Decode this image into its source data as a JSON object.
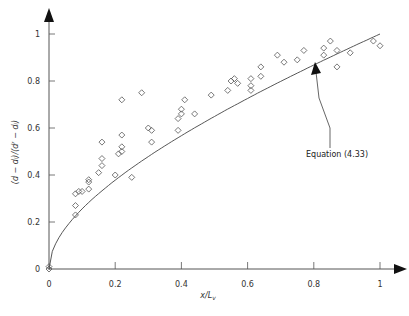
{
  "chart_data": {
    "type": "scatter",
    "title": "",
    "xlabel": "x/L_v",
    "ylabel": "(d − d_i)/(d_f − d_i)",
    "xlim": [
      0,
      1.05
    ],
    "ylim": [
      0,
      1.05
    ],
    "x_ticks": [
      "0",
      "0.2",
      "0.4",
      "0.6",
      "0.8",
      "1"
    ],
    "y_ticks": [
      "0",
      "0.2",
      "0.4",
      "0.6",
      "0.8",
      "1"
    ],
    "grid": false,
    "legend": null,
    "series": [
      {
        "name": "Measured data",
        "marker": "diamond-open",
        "points": [
          [
            0.0,
            0.0
          ],
          [
            0.0,
            0.01
          ],
          [
            0.08,
            0.23
          ],
          [
            0.08,
            0.27
          ],
          [
            0.08,
            0.32
          ],
          [
            0.09,
            0.33
          ],
          [
            0.1,
            0.33
          ],
          [
            0.12,
            0.34
          ],
          [
            0.12,
            0.37
          ],
          [
            0.12,
            0.38
          ],
          [
            0.15,
            0.41
          ],
          [
            0.16,
            0.44
          ],
          [
            0.16,
            0.47
          ],
          [
            0.16,
            0.54
          ],
          [
            0.2,
            0.4
          ],
          [
            0.21,
            0.49
          ],
          [
            0.22,
            0.5
          ],
          [
            0.22,
            0.52
          ],
          [
            0.22,
            0.57
          ],
          [
            0.22,
            0.72
          ],
          [
            0.25,
            0.39
          ],
          [
            0.28,
            0.75
          ],
          [
            0.3,
            0.6
          ],
          [
            0.31,
            0.54
          ],
          [
            0.31,
            0.59
          ],
          [
            0.39,
            0.59
          ],
          [
            0.39,
            0.64
          ],
          [
            0.4,
            0.66
          ],
          [
            0.4,
            0.68
          ],
          [
            0.41,
            0.72
          ],
          [
            0.44,
            0.66
          ],
          [
            0.49,
            0.74
          ],
          [
            0.54,
            0.76
          ],
          [
            0.55,
            0.8
          ],
          [
            0.56,
            0.81
          ],
          [
            0.57,
            0.79
          ],
          [
            0.61,
            0.78
          ],
          [
            0.61,
            0.76
          ],
          [
            0.61,
            0.81
          ],
          [
            0.64,
            0.82
          ],
          [
            0.64,
            0.86
          ],
          [
            0.69,
            0.91
          ],
          [
            0.71,
            0.88
          ],
          [
            0.75,
            0.89
          ],
          [
            0.77,
            0.93
          ],
          [
            0.83,
            0.91
          ],
          [
            0.83,
            0.94
          ],
          [
            0.85,
            0.97
          ],
          [
            0.87,
            0.86
          ],
          [
            0.87,
            0.93
          ],
          [
            0.91,
            0.92
          ],
          [
            0.98,
            0.97
          ],
          [
            1.0,
            0.95
          ]
        ]
      },
      {
        "name": "Equation (4.33)",
        "line": "solid",
        "points": [
          [
            0.0,
            0.0
          ],
          [
            0.01,
            0.1
          ],
          [
            0.03,
            0.17
          ],
          [
            0.05,
            0.22
          ],
          [
            0.08,
            0.28
          ],
          [
            0.1,
            0.32
          ],
          [
            0.15,
            0.39
          ],
          [
            0.2,
            0.45
          ],
          [
            0.25,
            0.5
          ],
          [
            0.3,
            0.55
          ],
          [
            0.35,
            0.59
          ],
          [
            0.4,
            0.63
          ],
          [
            0.5,
            0.71
          ],
          [
            0.6,
            0.77
          ],
          [
            0.7,
            0.84
          ],
          [
            0.8,
            0.89
          ],
          [
            0.9,
            0.95
          ],
          [
            1.0,
            1.0
          ]
        ]
      }
    ],
    "annotations": [
      {
        "text": "Equation (4.33)",
        "arrow_to": [
          0.82,
          0.89
        ],
        "text_at": [
          0.8,
          0.52
        ]
      }
    ]
  },
  "labels": {
    "annotation": "Equation (4.33)",
    "xlabel_main": "x/L",
    "xlabel_sub": "v",
    "ylabel": "(d − dᵢ)/(dᶠ − dᵢ)"
  }
}
